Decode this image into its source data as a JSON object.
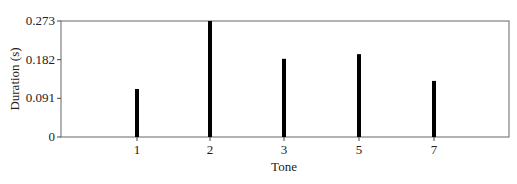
{
  "chart_data": {
    "type": "bar",
    "title": "",
    "xlabel": "Tone",
    "ylabel": "Duration (s)",
    "categories": [
      "1",
      "2",
      "3",
      "5",
      "7"
    ],
    "values": [
      0.113,
      0.273,
      0.184,
      0.195,
      0.132
    ],
    "ylim": [
      0,
      0.273
    ],
    "yticks": [
      "0",
      "0.091",
      "0.182",
      "0.273"
    ],
    "ytick_values": [
      0,
      0.091,
      0.182,
      0.273
    ],
    "grid": false,
    "legend": null,
    "bar_color": "#000000",
    "frame_color": "#666666"
  }
}
